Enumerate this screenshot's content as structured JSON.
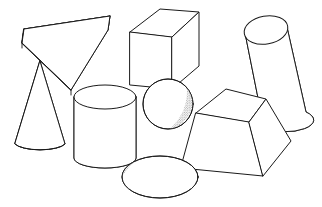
{
  "canvas": {
    "width": 322,
    "height": 207,
    "background": "#ffffff",
    "line_color": "#1a1a1a",
    "shade_color": "#6e6e6e",
    "description": "Line drawing of eight geometric solids arranged on a white field, each with cross-hatched or stippled shading on its right-facing surface"
  },
  "shapes": [
    {
      "id": "triangular-wedge",
      "name": "Triangular wedge prism",
      "position": "upper-left",
      "shading": "crosshatch",
      "shaded_face": "right rectangular face"
    },
    {
      "id": "cone",
      "name": "Cone",
      "position": "left",
      "shading": "stipple",
      "shaded_face": "right of lateral surface"
    },
    {
      "id": "cube",
      "name": "Cube",
      "position": "top-center",
      "shading": "crosshatch",
      "shaded_face": "right square face"
    },
    {
      "id": "cylinder",
      "name": "Cylinder",
      "position": "center-lower-left",
      "shading": "stipple",
      "shaded_face": "right of lateral surface"
    },
    {
      "id": "sphere",
      "name": "Sphere",
      "position": "center",
      "shading": "stipple crescent",
      "shaded_face": "lower-right crescent"
    },
    {
      "id": "tilted-frustum-cone",
      "name": "Tilted conical frustum",
      "position": "top-right",
      "shading": "stipple",
      "shaded_face": "right of lateral surface"
    },
    {
      "id": "truncated-pyramid",
      "name": "Truncated pyramid (frustum)",
      "position": "right-lower",
      "shading": "crosshatch",
      "shaded_face": "right trapezoidal face"
    },
    {
      "id": "ellipsoid-disc",
      "name": "Flattened ellipsoid disc",
      "position": "bottom-center",
      "shading": "stipple",
      "shaded_face": "lower rim crescent"
    }
  ]
}
